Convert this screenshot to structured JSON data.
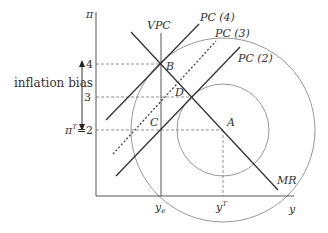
{
  "diagram": {
    "axes": {
      "y_label": "π",
      "x_label": "y",
      "x_ticks": [
        {
          "id": "ye",
          "label": "y",
          "sub": "e"
        },
        {
          "id": "yT",
          "label": "y",
          "sup": "T"
        }
      ],
      "y_ticks": [
        {
          "value": "4"
        },
        {
          "value": "3"
        },
        {
          "value": "2",
          "label": "π",
          "sup": "T",
          "text": "=2"
        }
      ]
    },
    "curves": {
      "vpc": "VPC",
      "pc4": "PC (4)",
      "pc3": "PC (3)",
      "pc2": "PC (2)",
      "mr": "MR"
    },
    "points": {
      "a": "A",
      "b": "B",
      "c": "C",
      "d": "D"
    },
    "annotation": "inflation bias",
    "colors": {
      "line": "#333333",
      "circle": "#888888",
      "dashed": "#777777"
    }
  }
}
